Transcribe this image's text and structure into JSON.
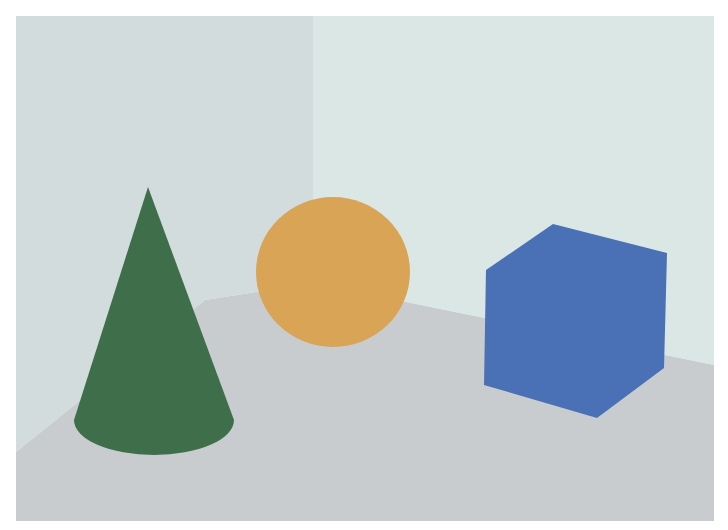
{
  "scene": {
    "canvas": {
      "width": 728,
      "height": 530,
      "background": "#ffffff"
    },
    "frame": {
      "x": 16,
      "y": 16,
      "width": 698,
      "height": 505
    },
    "colors": {
      "left_wall": "#d3dcdc",
      "right_wall": "#dbe7e5",
      "floor": "#c9cccf",
      "cone": "#3e6e4a",
      "sphere": "#d9a455",
      "cube": "#4a70b6"
    },
    "walls": {
      "left_wall_points": "16,16 313,16 313,283 205,300 16,452",
      "right_wall_points": "313,16 714,16 714,365 313,283"
    },
    "floor": {
      "points": "16,452 205,300 313,283 714,365 714,521 16,521"
    },
    "objects": [
      {
        "name": "cone",
        "shape": "cone",
        "color": "#3e6e4a",
        "tip": [
          148,
          187
        ],
        "base": {
          "cx": 154,
          "cy": 420,
          "rx": 80,
          "ry": 35
        }
      },
      {
        "name": "sphere",
        "shape": "sphere",
        "color": "#d9a455",
        "center": [
          333,
          272
        ],
        "rx": 77,
        "ry": 75
      },
      {
        "name": "cube",
        "shape": "cube",
        "color": "#4a70b6",
        "points": "553,224 667,253 664,368 597,418 484,385 486,270"
      }
    ]
  }
}
